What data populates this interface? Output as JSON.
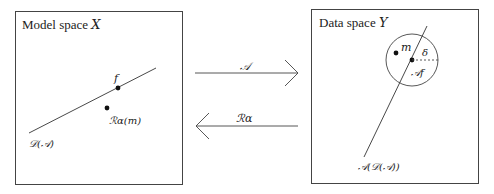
{
  "left_panel": {
    "title": "Model space X",
    "title_prefix": "Model space ",
    "title_var": "X",
    "line_label": "𝒟(𝒜)",
    "point_f_label": "f",
    "point_r_label": "ℛα(m)"
  },
  "right_panel": {
    "title_prefix": "Data space ",
    "title_var": "Y",
    "point_m_label": "m",
    "point_af_label": "𝒜f",
    "radius_label": "δ",
    "line_label": "𝒜(𝒟(𝒜))"
  },
  "arrows": {
    "forward_label": "𝒜",
    "backward_label": "ℛα"
  },
  "colors": {
    "stroke": "#333333",
    "text": "#222222",
    "background": "#ffffff"
  }
}
